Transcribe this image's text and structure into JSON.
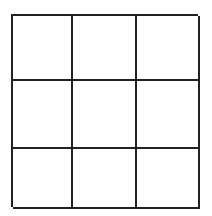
{
  "game": {
    "type": "tic-tac-toe",
    "rows": 3,
    "cols": 3,
    "line_color": "#222222",
    "background": "#ffffff",
    "cells": [
      [
        "",
        "",
        ""
      ],
      [
        "",
        "",
        ""
      ],
      [
        "",
        "",
        ""
      ]
    ]
  }
}
